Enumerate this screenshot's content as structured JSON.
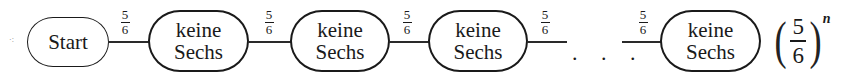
{
  "diagram": {
    "type": "path-diagram",
    "start_node": {
      "label": "Start"
    },
    "nodes": [
      {
        "line1": "keine",
        "line2": "Sechs"
      },
      {
        "line1": "keine",
        "line2": "Sechs"
      },
      {
        "line1": "keine",
        "line2": "Sechs"
      },
      {
        "line1": "keine",
        "line2": "Sechs"
      }
    ],
    "edges": [
      {
        "numerator": "5",
        "denominator": "6"
      },
      {
        "numerator": "5",
        "denominator": "6"
      },
      {
        "numerator": "5",
        "denominator": "6"
      },
      {
        "numerator": "5",
        "denominator": "6"
      },
      {
        "numerator": "5",
        "denominator": "6"
      }
    ],
    "ellipsis": ". . .",
    "result": {
      "numerator": "5",
      "denominator": "6",
      "exponent": "n",
      "left_paren": "(",
      "right_paren": ")"
    },
    "colors": {
      "stroke": "#1a1a1a",
      "background": "#ffffff"
    }
  }
}
